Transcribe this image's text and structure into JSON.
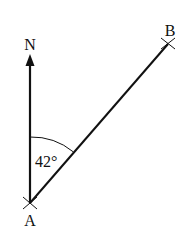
{
  "diagram": {
    "type": "bearing",
    "points": {
      "A": {
        "label": "A"
      },
      "B": {
        "label": "B"
      },
      "N": {
        "label": "N"
      }
    },
    "angle": {
      "label": "42°",
      "value_deg": 42,
      "between": [
        "AN",
        "AB"
      ]
    },
    "colors": {
      "stroke": "#111111",
      "background": "#ffffff"
    }
  }
}
